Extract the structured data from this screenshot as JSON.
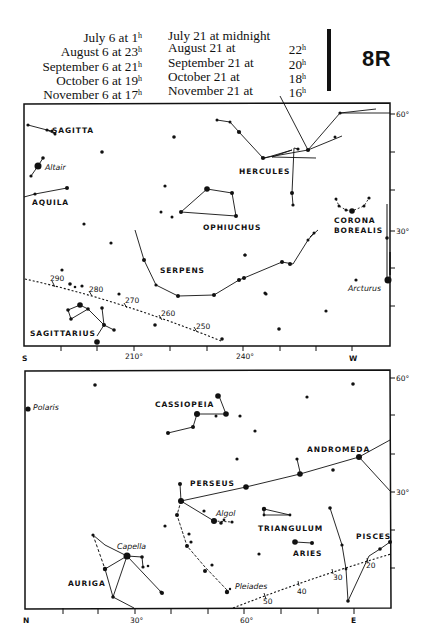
{
  "header": {
    "left_column": [
      {
        "text": "July 6 at 1",
        "sup": "h"
      },
      {
        "text": "August 6 at 23",
        "sup": "h"
      },
      {
        "text": "September 6 at 21",
        "sup": "h"
      },
      {
        "text": "October 6 at 19",
        "sup": "h"
      },
      {
        "text": "November 6 at 17",
        "sup": "h"
      }
    ],
    "right_column": [
      {
        "date": "July 21 at midnight",
        "time": "",
        "sup": ""
      },
      {
        "date": "August 21 at",
        "time": "22",
        "sup": "h"
      },
      {
        "date": "September 21 at",
        "time": "20",
        "sup": "h"
      },
      {
        "date": "October 21 at",
        "time": "18",
        "sup": "h"
      },
      {
        "date": "November 21 at",
        "time": "16",
        "sup": "h"
      }
    ],
    "plate_id": "8R"
  },
  "upper_map": {
    "direction_left": "S",
    "direction_right": "W",
    "x_labels": [
      {
        "x": 97,
        "text": "210°"
      },
      {
        "x": 243,
        "text": "240°"
      }
    ],
    "dec_labels": [
      {
        "y": 108,
        "text": "60°"
      },
      {
        "y": 233,
        "text": "30°"
      }
    ],
    "constellations": [
      {
        "name": "SAGITTA",
        "x": 52,
        "y": 133
      },
      {
        "name": "AQUILA",
        "x": 32,
        "y": 205
      },
      {
        "name": "HERCULES",
        "x": 239,
        "y": 174
      },
      {
        "name": "OPHIUCHUS",
        "x": 203,
        "y": 230
      },
      {
        "name": "CORONA",
        "x": 334,
        "y": 223
      },
      {
        "name": "BOREALIS",
        "x": 334,
        "y": 233
      },
      {
        "name": "SERPENS",
        "x": 160,
        "y": 273
      },
      {
        "name": "SAGITTARIUS",
        "x": 30,
        "y": 336
      }
    ],
    "named_stars": [
      {
        "name": "Altair",
        "x": 45,
        "y": 170
      },
      {
        "name": "Arcturus",
        "x": 348,
        "y": 291
      }
    ],
    "ecliptic_marks": [
      {
        "text": "290",
        "x": 50,
        "y": 281
      },
      {
        "text": "280",
        "x": 89,
        "y": 292
      },
      {
        "text": "270",
        "x": 125,
        "y": 303
      },
      {
        "text": "260",
        "x": 161,
        "y": 316
      },
      {
        "text": "250",
        "x": 196,
        "y": 329
      }
    ]
  },
  "lower_map": {
    "direction_left": "N",
    "direction_right": "E",
    "x_labels": [
      {
        "x": 135,
        "text": "30°"
      },
      {
        "x": 244,
        "text": "60°"
      }
    ],
    "dec_labels": [
      {
        "y": 378,
        "text": "60°"
      },
      {
        "y": 492,
        "text": "30°"
      }
    ],
    "constellations": [
      {
        "name": "CASSIOPEIA",
        "x": 155,
        "y": 407
      },
      {
        "name": "ANDROMEDA",
        "x": 307,
        "y": 452
      },
      {
        "name": "PERSEUS",
        "x": 190,
        "y": 486
      },
      {
        "name": "TRIANGULUM",
        "x": 258,
        "y": 531
      },
      {
        "name": "ARIES",
        "x": 293,
        "y": 556
      },
      {
        "name": "PISCES",
        "x": 356,
        "y": 539
      },
      {
        "name": "AURIGA",
        "x": 68,
        "y": 586
      }
    ],
    "named_stars": [
      {
        "name": "Polaris",
        "x": 33,
        "y": 410
      },
      {
        "name": "Capella",
        "x": 117,
        "y": 549
      },
      {
        "name": "Algol",
        "x": 216,
        "y": 516
      },
      {
        "name": "Pleiades",
        "x": 235,
        "y": 589
      }
    ],
    "ecliptic_marks": [
      {
        "text": "20",
        "x": 366,
        "y": 568
      },
      {
        "text": "30",
        "x": 333,
        "y": 580
      },
      {
        "text": "40",
        "x": 297,
        "y": 594
      },
      {
        "text": "50",
        "x": 263,
        "y": 604
      }
    ]
  },
  "colors": {
    "ink": "#111111",
    "paper": "#ffffff"
  }
}
